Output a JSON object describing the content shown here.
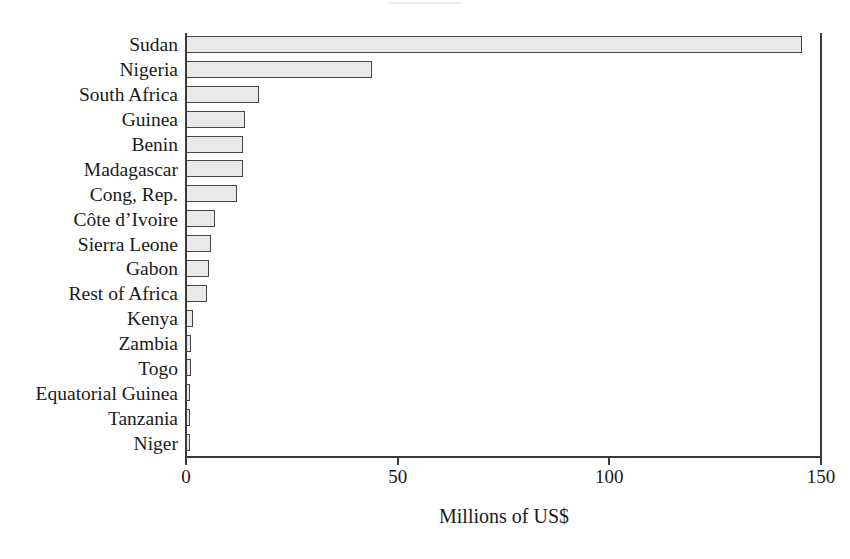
{
  "figure": {
    "title_remnant": "ᵩᵩᵩᵩᵩᵩᵩᵩᵩᵩᵩᵩᵩᵩ",
    "axis_title": "Millions of US$",
    "bar_fill_color": "#e9e9e9",
    "bar_border_color": "#454545",
    "axis_color": "#3a3a3a",
    "background_color": "#ffffff"
  },
  "chart_data": {
    "type": "bar",
    "orientation": "horizontal",
    "title": "",
    "xlabel": "Millions of US$",
    "ylabel": "",
    "xlim": [
      0,
      150
    ],
    "xticks": [
      0,
      50,
      100,
      150
    ],
    "xtick_labels": [
      "0",
      "50",
      "100",
      "150"
    ],
    "grid": false,
    "legend": null,
    "categories": [
      "Sudan",
      "Nigeria",
      "South Africa",
      "Guinea",
      "Benin",
      "Madagascar",
      "Cong, Rep.",
      "Côte d’Ivoire",
      "Sierra Leone",
      "Gabon",
      "Rest of Africa",
      "Kenya",
      "Zambia",
      "Togo",
      "Equatorial Guinea",
      "Tanzania",
      "Niger"
    ],
    "values": [
      145.5,
      44.0,
      17.3,
      14.0,
      13.4,
      13.4,
      12.0,
      6.9,
      6.0,
      5.5,
      5.0,
      1.7,
      1.2,
      1.2,
      0.9,
      0.6,
      0.6
    ],
    "units": "Millions of US$"
  }
}
